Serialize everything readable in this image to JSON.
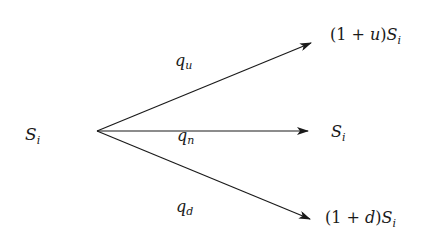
{
  "diagram": {
    "type": "trinomial-tree-branch",
    "start_node": {
      "base": "S",
      "sub": "i"
    },
    "branches": [
      {
        "id": "up",
        "prob": {
          "base": "q",
          "sub": "u"
        },
        "result": {
          "prefix": "(1 + ",
          "var": "u",
          "suffix": ")",
          "base": "S",
          "sub": "i"
        }
      },
      {
        "id": "neutral",
        "prob": {
          "base": "q",
          "sub": "n"
        },
        "result": {
          "base": "S",
          "sub": "i"
        }
      },
      {
        "id": "down",
        "prob": {
          "base": "q",
          "sub": "d"
        },
        "result": {
          "prefix": "(1 + ",
          "var": "d",
          "suffix": ")",
          "base": "S",
          "sub": "i"
        }
      }
    ],
    "colors": {
      "line": "#1a1a1a",
      "text": "#1a1a1a",
      "background": "#ffffff"
    }
  }
}
